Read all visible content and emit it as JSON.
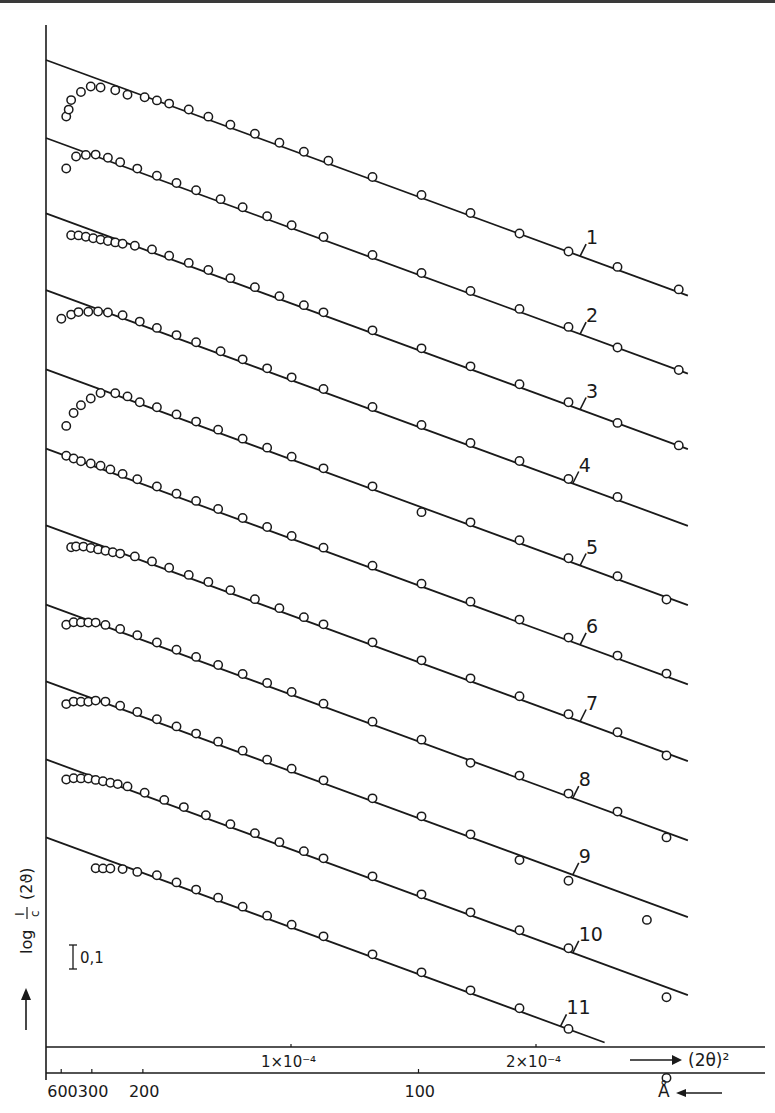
{
  "chart_data": {
    "type": "scatter",
    "title": "",
    "xlabel": "(2θ)²",
    "xlabel_arrow": "→",
    "x2label": "Å",
    "x2label_arrow": "←",
    "ylabel": "log I/c (2θ)",
    "ylabel_parts": {
      "log": "log",
      "num": "I",
      "den": "c",
      "arg": "(2ϑ)",
      "arrow": "→"
    },
    "scale_bar_label": "0,1",
    "scale_bar_value": 0.1,
    "x_unit": 0.0001,
    "xlim": [
      0,
      0.000293
    ],
    "x_ticks": [
      {
        "value": 0.0001,
        "label": "1×10⁻⁴"
      },
      {
        "value": 0.0002,
        "label": "2×10⁻⁴"
      }
    ],
    "x2_ticks": [
      {
        "value_A": 600,
        "label": "600"
      },
      {
        "value_A": 300,
        "label": "300"
      },
      {
        "value_A": 200,
        "label": "200"
      },
      {
        "value_A": 100,
        "label": "100"
      }
    ],
    "grid": false,
    "line_slope_per_1e-4": -0.346,
    "series": [
      {
        "name": "1",
        "intercept": 0.0,
        "x_end": 2.62,
        "label_x": 2.18,
        "points": [
          [
            0.05,
            -0.2
          ],
          [
            0.06,
            -0.17
          ],
          [
            0.07,
            -0.13
          ],
          [
            0.11,
            -0.085
          ],
          [
            0.15,
            -0.05
          ],
          [
            0.19,
            -0.04
          ],
          [
            0.25,
            -0.03
          ],
          [
            0.3,
            -0.03
          ],
          [
            0.37,
            -0.015
          ],
          [
            0.42,
            -0.01
          ],
          [
            0.47,
            -0.005
          ],
          [
            0.55,
            0
          ],
          [
            0.63,
            0
          ],
          [
            0.72,
            0
          ],
          [
            0.82,
            0
          ],
          [
            0.92,
            0
          ],
          [
            1.02,
            0
          ],
          [
            1.12,
            0
          ],
          [
            1.3,
            0
          ],
          [
            1.5,
            0
          ],
          [
            1.7,
            0
          ],
          [
            1.9,
            -0.01
          ],
          [
            2.1,
            -0.01
          ],
          [
            2.3,
            0
          ],
          [
            2.55,
            0
          ]
        ]
      },
      {
        "name": "2",
        "intercept": -0.3,
        "x_end": 2.62,
        "label_x": 2.18,
        "points": [
          [
            0.05,
            -0.1
          ],
          [
            0.09,
            -0.04
          ],
          [
            0.13,
            -0.02
          ],
          [
            0.17,
            -0.005
          ],
          [
            0.22,
            0
          ],
          [
            0.27,
            0
          ],
          [
            0.34,
            0
          ],
          [
            0.42,
            0
          ],
          [
            0.5,
            0
          ],
          [
            0.58,
            0
          ],
          [
            0.68,
            0
          ],
          [
            0.77,
            0
          ],
          [
            0.87,
            0
          ],
          [
            0.97,
            0
          ],
          [
            1.1,
            0
          ],
          [
            1.3,
            0
          ],
          [
            1.5,
            0
          ],
          [
            1.7,
            0
          ],
          [
            1.9,
            0
          ],
          [
            2.1,
            0
          ],
          [
            2.3,
            -0.01
          ],
          [
            2.55,
            -0.01
          ]
        ]
      },
      {
        "name": "3",
        "intercept": -0.59,
        "x_end": 2.62,
        "label_x": 2.18,
        "points": [
          [
            0.07,
            -0.06
          ],
          [
            0.1,
            -0.05
          ],
          [
            0.13,
            -0.045
          ],
          [
            0.16,
            -0.04
          ],
          [
            0.19,
            -0.035
          ],
          [
            0.22,
            -0.03
          ],
          [
            0.25,
            -0.025
          ],
          [
            0.28,
            -0.02
          ],
          [
            0.33,
            -0.01
          ],
          [
            0.4,
            0
          ],
          [
            0.47,
            0
          ],
          [
            0.55,
            0
          ],
          [
            0.63,
            0
          ],
          [
            0.72,
            0
          ],
          [
            0.82,
            0
          ],
          [
            0.92,
            0
          ],
          [
            1.02,
            0
          ],
          [
            1.1,
            0
          ],
          [
            1.3,
            0
          ],
          [
            1.5,
            0
          ],
          [
            1.7,
            0
          ],
          [
            1.9,
            0
          ],
          [
            2.1,
            0
          ],
          [
            2.3,
            -0.01
          ],
          [
            2.55,
            -0.01
          ]
        ]
      },
      {
        "name": "4",
        "intercept": -0.885,
        "x_end": 2.62,
        "label_x": 2.15,
        "points": [
          [
            0.03,
            -0.1
          ],
          [
            0.07,
            -0.07
          ],
          [
            0.1,
            -0.05
          ],
          [
            0.14,
            -0.035
          ],
          [
            0.18,
            -0.02
          ],
          [
            0.22,
            -0.01
          ],
          [
            0.28,
            0
          ],
          [
            0.35,
            0
          ],
          [
            0.42,
            0
          ],
          [
            0.5,
            0
          ],
          [
            0.58,
            0
          ],
          [
            0.68,
            0
          ],
          [
            0.77,
            0
          ],
          [
            0.87,
            0
          ],
          [
            0.97,
            0
          ],
          [
            1.1,
            0
          ],
          [
            1.3,
            0
          ],
          [
            1.5,
            0
          ],
          [
            1.7,
            0
          ],
          [
            1.9,
            0
          ],
          [
            2.1,
            0
          ],
          [
            2.3,
            0
          ]
        ]
      },
      {
        "name": "5",
        "intercept": -1.19,
        "x_end": 2.62,
        "label_x": 2.18,
        "points": [
          [
            0.05,
            -0.2
          ],
          [
            0.08,
            -0.14
          ],
          [
            0.11,
            -0.1
          ],
          [
            0.15,
            -0.06
          ],
          [
            0.19,
            -0.025
          ],
          [
            0.25,
            -0.005
          ],
          [
            0.3,
            0
          ],
          [
            0.35,
            -0.005
          ],
          [
            0.42,
            0
          ],
          [
            0.5,
            0
          ],
          [
            0.58,
            0
          ],
          [
            0.67,
            0
          ],
          [
            0.77,
            0
          ],
          [
            0.87,
            0
          ],
          [
            0.97,
            0
          ],
          [
            1.1,
            0
          ],
          [
            1.3,
            0
          ],
          [
            1.5,
            -0.03
          ],
          [
            1.7,
            0
          ],
          [
            1.9,
            0
          ],
          [
            2.1,
            0
          ],
          [
            2.3,
            0
          ],
          [
            2.5,
            -0.02
          ]
        ]
      },
      {
        "name": "6",
        "intercept": -1.495,
        "x_end": 2.62,
        "label_x": 2.18,
        "points": [
          [
            0.05,
            -0.01
          ],
          [
            0.08,
            -0.01
          ],
          [
            0.11,
            -0.01
          ],
          [
            0.15,
            -0.005
          ],
          [
            0.19,
            0
          ],
          [
            0.23,
            0
          ],
          [
            0.28,
            0
          ],
          [
            0.34,
            0
          ],
          [
            0.42,
            0
          ],
          [
            0.5,
            0
          ],
          [
            0.58,
            0
          ],
          [
            0.67,
            0
          ],
          [
            0.77,
            0
          ],
          [
            0.87,
            0
          ],
          [
            0.97,
            0
          ],
          [
            1.1,
            0
          ],
          [
            1.3,
            0
          ],
          [
            1.5,
            0
          ],
          [
            1.7,
            0
          ],
          [
            1.9,
            0
          ],
          [
            2.1,
            0
          ],
          [
            2.3,
            0
          ],
          [
            2.5,
            0
          ]
        ]
      },
      {
        "name": "7",
        "intercept": -1.79,
        "x_end": 2.62,
        "label_x": 2.18,
        "points": [
          [
            0.07,
            -0.06
          ],
          [
            0.09,
            -0.05
          ],
          [
            0.12,
            -0.04
          ],
          [
            0.15,
            -0.035
          ],
          [
            0.18,
            -0.03
          ],
          [
            0.21,
            -0.025
          ],
          [
            0.24,
            -0.02
          ],
          [
            0.27,
            -0.015
          ],
          [
            0.33,
            -0.005
          ],
          [
            0.4,
            0
          ],
          [
            0.47,
            0
          ],
          [
            0.55,
            0
          ],
          [
            0.63,
            0
          ],
          [
            0.72,
            0
          ],
          [
            0.82,
            0
          ],
          [
            0.92,
            0
          ],
          [
            1.02,
            0
          ],
          [
            1.1,
            0
          ],
          [
            1.3,
            0
          ],
          [
            1.5,
            0
          ],
          [
            1.7,
            0
          ],
          [
            1.9,
            0
          ],
          [
            2.1,
            0
          ],
          [
            2.3,
            0
          ],
          [
            2.5,
            -0.02
          ]
        ]
      },
      {
        "name": "8",
        "intercept": -2.095,
        "x_end": 2.62,
        "label_x": 2.15,
        "points": [
          [
            0.05,
            -0.06
          ],
          [
            0.08,
            -0.04
          ],
          [
            0.11,
            -0.03
          ],
          [
            0.14,
            -0.02
          ],
          [
            0.17,
            -0.01
          ],
          [
            0.21,
            -0.005
          ],
          [
            0.27,
            0
          ],
          [
            0.34,
            0
          ],
          [
            0.42,
            0
          ],
          [
            0.5,
            0
          ],
          [
            0.58,
            0
          ],
          [
            0.67,
            0
          ],
          [
            0.77,
            0
          ],
          [
            0.87,
            0
          ],
          [
            0.97,
            0
          ],
          [
            1.1,
            0
          ],
          [
            1.3,
            0
          ],
          [
            1.5,
            0
          ],
          [
            1.7,
            -0.02
          ],
          [
            1.9,
            0
          ],
          [
            2.1,
            0
          ],
          [
            2.3,
            0
          ],
          [
            2.5,
            -0.03
          ]
        ]
      },
      {
        "name": "9",
        "intercept": -2.39,
        "x_end": 2.62,
        "label_x": 2.15,
        "points": [
          [
            0.05,
            -0.07
          ],
          [
            0.08,
            -0.05
          ],
          [
            0.11,
            -0.04
          ],
          [
            0.14,
            -0.03
          ],
          [
            0.17,
            -0.015
          ],
          [
            0.21,
            -0.005
          ],
          [
            0.27,
            0
          ],
          [
            0.34,
            0
          ],
          [
            0.42,
            0
          ],
          [
            0.5,
            0
          ],
          [
            0.58,
            0
          ],
          [
            0.67,
            0
          ],
          [
            0.77,
            0
          ],
          [
            0.87,
            0
          ],
          [
            0.97,
            0
          ],
          [
            1.1,
            0
          ],
          [
            1.3,
            0
          ],
          [
            1.5,
            0
          ],
          [
            1.7,
            0
          ],
          [
            1.9,
            -0.03
          ],
          [
            2.1,
            -0.04
          ],
          [
            2.42,
            -0.08
          ]
        ]
      },
      {
        "name": "10",
        "intercept": -2.69,
        "x_end": 2.62,
        "label_x": 2.15,
        "points": [
          [
            0.05,
            -0.06
          ],
          [
            0.08,
            -0.045
          ],
          [
            0.11,
            -0.035
          ],
          [
            0.14,
            -0.025
          ],
          [
            0.17,
            -0.02
          ],
          [
            0.2,
            -0.015
          ],
          [
            0.23,
            -0.01
          ],
          [
            0.26,
            -0.005
          ],
          [
            0.3,
            0
          ],
          [
            0.37,
            0
          ],
          [
            0.45,
            0
          ],
          [
            0.53,
            0
          ],
          [
            0.62,
            0
          ],
          [
            0.72,
            0
          ],
          [
            0.82,
            0
          ],
          [
            0.92,
            0
          ],
          [
            1.02,
            0
          ],
          [
            1.1,
            0
          ],
          [
            1.3,
            0
          ],
          [
            1.5,
            0
          ],
          [
            1.7,
            0
          ],
          [
            1.9,
            0
          ],
          [
            2.1,
            0
          ],
          [
            2.5,
            -0.05
          ]
        ]
      },
      {
        "name": "11",
        "intercept": -2.99,
        "x_end": 2.28,
        "label_x": 2.1,
        "points": [
          [
            0.17,
            -0.06
          ],
          [
            0.2,
            -0.05
          ],
          [
            0.23,
            -0.04
          ],
          [
            0.28,
            -0.025
          ],
          [
            0.34,
            -0.015
          ],
          [
            0.42,
            0
          ],
          [
            0.5,
            0
          ],
          [
            0.58,
            0
          ],
          [
            0.67,
            0
          ],
          [
            0.77,
            0
          ],
          [
            0.87,
            0
          ],
          [
            0.97,
            0
          ],
          [
            1.1,
            0
          ],
          [
            1.3,
            0
          ],
          [
            1.5,
            0
          ],
          [
            1.7,
            0
          ],
          [
            1.9,
            0
          ],
          [
            2.1,
            -0.01
          ],
          [
            2.5,
            -0.06
          ]
        ]
      }
    ]
  }
}
